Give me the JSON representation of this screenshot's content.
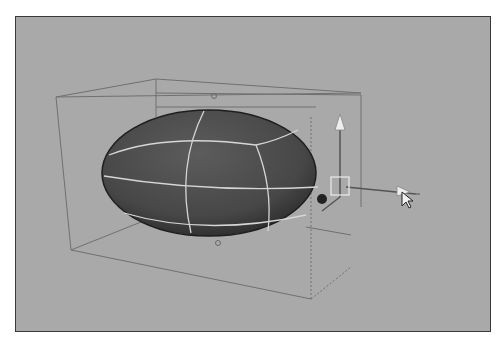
{
  "viewport": {
    "name": "3D perspective viewport",
    "background_color": "#a9a9a9",
    "border_color": "#3a3a3a"
  },
  "scene": {
    "object": {
      "type": "deformed-sphere",
      "shade_color": "#4a4a4a",
      "isoparm_color": "#d8d8d8"
    },
    "lattice": {
      "type": "lattice-deformer-box",
      "line_color": "#6e6e6e",
      "control_points": 4
    },
    "manipulator": {
      "type": "move-tool",
      "axes": [
        "y",
        "x",
        "z"
      ],
      "handle_color": "#e8e8e8"
    },
    "cursor": {
      "type": "arrow-pointer"
    }
  }
}
